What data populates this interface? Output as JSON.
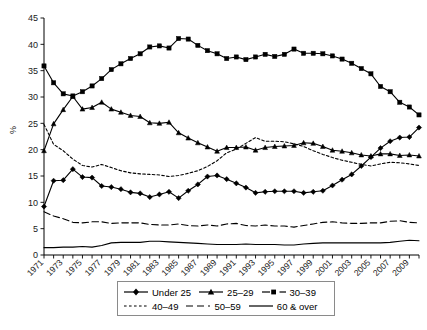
{
  "chart_data": {
    "type": "line",
    "title": "",
    "xlabel": "",
    "ylabel": "%",
    "ylim": [
      0,
      45
    ],
    "ytick_step": 5,
    "yticks": [
      0,
      5,
      10,
      15,
      20,
      25,
      30,
      35,
      40,
      45
    ],
    "xlim": [
      1971,
      2010
    ],
    "grid": false,
    "legend_position": "bottom",
    "x": [
      1971,
      1972,
      1973,
      1974,
      1975,
      1976,
      1977,
      1978,
      1979,
      1980,
      1981,
      1982,
      1983,
      1984,
      1985,
      1986,
      1987,
      1988,
      1989,
      1990,
      1991,
      1992,
      1993,
      1994,
      1995,
      1996,
      1997,
      1998,
      1999,
      2000,
      2001,
      2002,
      2003,
      2004,
      2005,
      2006,
      2007,
      2008,
      2009,
      2010
    ],
    "xtick_labels": [
      "1971",
      "1973",
      "1975",
      "1977",
      "1979",
      "1981",
      "1983",
      "1985",
      "1987",
      "1989",
      "1991",
      "1993",
      "1995",
      "1997",
      "1999",
      "2001",
      "2003",
      "2005",
      "2007",
      "2009"
    ],
    "series": [
      {
        "name": "Under 25",
        "marker": "diamond",
        "dash": "solid",
        "values": [
          9.2,
          14.1,
          14.2,
          16.3,
          14.8,
          14.7,
          13.1,
          12.9,
          12.5,
          11.9,
          11.7,
          11.0,
          11.5,
          12.0,
          10.8,
          12.2,
          13.4,
          14.9,
          15.1,
          14.4,
          13.6,
          12.8,
          11.8,
          12.0,
          12.1,
          12.1,
          12.1,
          11.8,
          12.0,
          12.2,
          13.2,
          14.3,
          15.3,
          16.9,
          18.6,
          20.3,
          21.6,
          22.3,
          22.4,
          24.2
        ]
      },
      {
        "name": "25–29",
        "marker": "triangle",
        "dash": "solid",
        "values": [
          19.8,
          24.9,
          27.6,
          30.1,
          27.7,
          28.0,
          29.0,
          27.7,
          27.1,
          26.5,
          26.3,
          25.1,
          25.0,
          25.2,
          23.2,
          22.2,
          21.3,
          20.5,
          19.7,
          20.4,
          20.4,
          20.5,
          19.9,
          20.4,
          20.6,
          20.7,
          20.8,
          21.3,
          21.2,
          20.6,
          19.9,
          19.7,
          19.4,
          19.0,
          18.8,
          19.2,
          19.2,
          18.9,
          19.0,
          18.8
        ]
      },
      {
        "name": "30–39",
        "marker": "square",
        "dash": "solid",
        "values": [
          35.9,
          32.7,
          30.6,
          30.2,
          31.0,
          32.1,
          33.5,
          35.2,
          36.3,
          37.3,
          38.2,
          39.5,
          39.7,
          39.3,
          41.1,
          41.0,
          39.8,
          38.8,
          38.2,
          37.3,
          37.6,
          37.1,
          37.6,
          38.1,
          37.7,
          38.1,
          39.1,
          38.3,
          38.3,
          38.2,
          37.8,
          37.2,
          36.4,
          35.4,
          34.4,
          32.0,
          31.0,
          29.0,
          28.1,
          26.6
        ]
      },
      {
        "name": "40–49",
        "marker": "none",
        "dash": "dotted",
        "values": [
          24.8,
          21.0,
          19.8,
          18.2,
          17.0,
          16.7,
          17.2,
          16.6,
          16.0,
          15.6,
          15.4,
          15.3,
          15.2,
          14.9,
          15.1,
          15.5,
          16.0,
          16.8,
          17.9,
          19.4,
          20.1,
          21.2,
          22.3,
          21.6,
          21.6,
          21.5,
          21.1,
          20.6,
          19.8,
          19.1,
          18.5,
          18.0,
          17.6,
          17.2,
          16.9,
          17.3,
          17.6,
          17.5,
          17.3,
          17.0
        ]
      },
      {
        "name": "50–59",
        "marker": "none",
        "dash": "dashed",
        "values": [
          8.2,
          7.4,
          6.9,
          6.2,
          6.1,
          6.3,
          6.3,
          6.0,
          6.1,
          6.1,
          6.1,
          5.8,
          5.7,
          5.7,
          5.9,
          5.6,
          5.5,
          5.7,
          5.5,
          5.9,
          6.0,
          5.6,
          5.5,
          5.7,
          5.5,
          5.5,
          5.3,
          5.6,
          5.9,
          6.2,
          6.3,
          6.1,
          6.0,
          6.0,
          6.1,
          6.1,
          6.4,
          6.5,
          6.2,
          6.1
        ]
      },
      {
        "name": "60 & over",
        "marker": "none",
        "dash": "solid",
        "values": [
          1.4,
          1.4,
          1.5,
          1.5,
          1.6,
          1.5,
          1.8,
          2.3,
          2.4,
          2.4,
          2.4,
          2.6,
          2.6,
          2.5,
          2.4,
          2.3,
          2.2,
          2.1,
          2.0,
          2.0,
          2.0,
          2.1,
          2.0,
          2.0,
          2.0,
          1.9,
          1.9,
          2.1,
          2.2,
          2.3,
          2.3,
          2.3,
          2.3,
          2.3,
          2.3,
          2.3,
          2.4,
          2.6,
          2.8,
          2.7
        ]
      }
    ]
  },
  "legend": {
    "rows": [
      [
        {
          "label": "Under 25",
          "marker": "diamond",
          "dash": "solid"
        },
        {
          "label": "25–29",
          "marker": "triangle",
          "dash": "solid"
        },
        {
          "label": "30–39",
          "marker": "square",
          "dash": "dash-marker"
        }
      ],
      [
        {
          "label": "40–49",
          "marker": "none",
          "dash": "dotted"
        },
        {
          "label": "50–59",
          "marker": "none",
          "dash": "dashed"
        },
        {
          "label": "60 & over",
          "marker": "none",
          "dash": "solid"
        }
      ]
    ]
  },
  "colors": {
    "ink": "#000000",
    "background": "#ffffff",
    "legend_border": "#8a8a8a"
  }
}
